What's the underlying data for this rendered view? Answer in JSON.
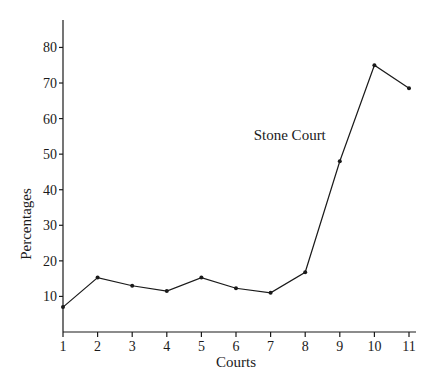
{
  "chart_data": {
    "type": "line",
    "title": "",
    "xlabel": "Courts",
    "ylabel": "Percentages",
    "categories": [
      "1",
      "2",
      "3",
      "4",
      "5",
      "6",
      "7",
      "8",
      "9",
      "10",
      "11"
    ],
    "x": [
      1,
      2,
      3,
      4,
      5,
      6,
      7,
      8,
      9,
      10,
      11
    ],
    "series": [
      {
        "name": "Percentages",
        "values": [
          7,
          15.3,
          13,
          11.5,
          15.3,
          12.3,
          11,
          16.8,
          48,
          75,
          68.5
        ]
      }
    ],
    "yticks": [
      10,
      20,
      30,
      40,
      50,
      60,
      70,
      80
    ],
    "ylim": [
      0,
      85
    ],
    "xlim": [
      1,
      11
    ],
    "grid": false,
    "legend": null,
    "annotations": [
      {
        "text": "Stone Court",
        "x": 9,
        "y": 48
      }
    ]
  }
}
